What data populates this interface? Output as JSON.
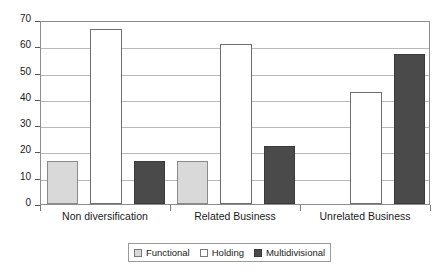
{
  "chart_data": {
    "type": "bar",
    "title": "",
    "subtitle": "",
    "xlabel": "",
    "ylabel": "",
    "ylim": [
      0,
      70
    ],
    "yticks": [
      0,
      10,
      20,
      30,
      40,
      50,
      60,
      70
    ],
    "ytick_labels": [
      "0",
      "10",
      "20",
      "30",
      "40",
      "50",
      "60",
      "70"
    ],
    "grid": true,
    "grid_axis": "y",
    "legend_position": "bottom",
    "categories": [
      "Non diversification",
      "Related Business",
      "Unrelated Business"
    ],
    "series": [
      {
        "name": "Functional",
        "color": "#d9d9d9",
        "values": [
          16.5,
          16.5,
          0
        ]
      },
      {
        "name": "Holding",
        "color": "#ffffff",
        "values": [
          66.5,
          61,
          42.5
        ]
      },
      {
        "name": "Multidivisional",
        "color": "#4a4a4a",
        "values": [
          16.5,
          22,
          57
        ]
      }
    ]
  },
  "legend": {
    "items": [
      {
        "label": "Functional",
        "swatch": "functional"
      },
      {
        "label": "Holding",
        "swatch": "holding"
      },
      {
        "label": "Multidivisional",
        "swatch": "multidivisional"
      }
    ]
  },
  "colors": {
    "functional": "#d9d9d9",
    "holding": "#ffffff",
    "multidivisional": "#4a4a4a",
    "gridline": "#b9b9b9",
    "axis": "#8c8c8c",
    "text": "#1a1a1a"
  }
}
